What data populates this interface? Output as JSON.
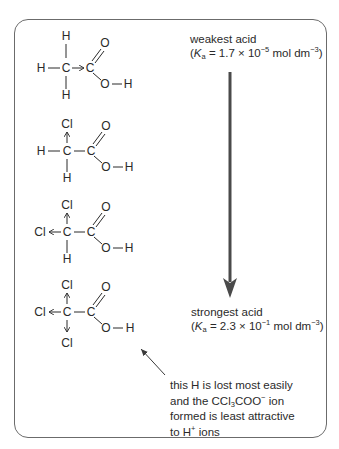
{
  "diagram": {
    "molecules": [
      {
        "name": "ethanoic acid",
        "substituents": {
          "top": "H",
          "left": "H",
          "bottom": "H"
        },
        "carbon": "C",
        "carboxyl": {
          "carbon": "C",
          "carbonyl_o": "O",
          "hydroxyl_o": "O",
          "h": "H"
        },
        "inductive_arrow": "C→C"
      },
      {
        "name": "chloroethanoic acid",
        "substituents": {
          "top": "Cl",
          "left": "H",
          "bottom": "H"
        },
        "carbon": "C",
        "carboxyl": {
          "carbon": "C",
          "carbonyl_o": "O",
          "hydroxyl_o": "O",
          "h": "H"
        }
      },
      {
        "name": "dichloroethanoic acid",
        "substituents": {
          "top": "Cl",
          "left": "Cl",
          "bottom": "H"
        },
        "carbon": "C",
        "carboxyl": {
          "carbon": "C",
          "carbonyl_o": "O",
          "hydroxyl_o": "O",
          "h": "H"
        }
      },
      {
        "name": "trichloroethanoic acid",
        "substituents": {
          "top": "Cl",
          "left": "Cl",
          "bottom": "Cl"
        },
        "carbon": "C",
        "carboxyl": {
          "carbon": "C",
          "carbonyl_o": "O",
          "hydroxyl_o": "O",
          "h": "H"
        }
      }
    ],
    "weakest": {
      "label": "weakest acid",
      "ka_prefix": "(",
      "ka_symbol": "K",
      "ka_sub": "a",
      "ka_value": " = 1.7 × 10",
      "ka_exp": "−5",
      "ka_unit": " mol dm",
      "ka_unit_exp": "−3",
      "ka_suffix": ")"
    },
    "strongest": {
      "label": "strongest acid",
      "ka_prefix": "(",
      "ka_symbol": "K",
      "ka_sub": "a",
      "ka_value": " = 2.3 × 10",
      "ka_exp": "−1",
      "ka_unit": " mol dm",
      "ka_unit_exp": "−3",
      "ka_suffix": ")"
    },
    "note": {
      "line1": "this H is lost most easily",
      "line2_a": "and the CCl",
      "line2_sub": "3",
      "line2_b": "COO",
      "line2_sup": "−",
      "line2_c": " ion",
      "line3": "formed is least attractive",
      "line4_a": "to H",
      "line4_sup": "+",
      "line4_b": " ions"
    },
    "colors": {
      "text": "#2a2a2a",
      "frame": "#6b6b6b",
      "arrow": "#4a4a4a"
    }
  }
}
